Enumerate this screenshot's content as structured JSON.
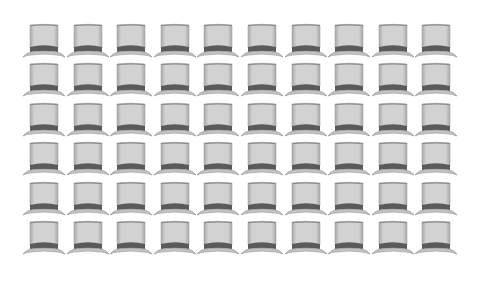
{
  "grid": {
    "columns": 10,
    "rows": 6,
    "icon": "top-hat-icon",
    "count": 60
  },
  "colors": {
    "background": "#ffffff",
    "crown_fill": "#d2d2d2",
    "crown_top": "#8c8c8c",
    "crown_edge": "#a8a8a8",
    "band": "#5a5a5a",
    "brim_fill": "#c4c4c4",
    "brim_edge": "#8e8e8e"
  }
}
